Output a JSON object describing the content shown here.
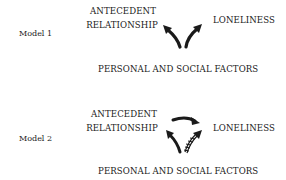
{
  "models": [
    {
      "label": "Model 1",
      "nodes": {
        "antecedent_line1": "ANTECEDENT",
        "antecedent_line2": "RELATIONSHIP",
        "loneliness": "LONELINESS",
        "personal_social": "PERSONAL AND SOCIAL FACTORS"
      },
      "edges": [
        {
          "from": "PERSONAL AND SOCIAL FACTORS",
          "to": "ANTECEDENT RELATIONSHIP",
          "style": "solid"
        },
        {
          "from": "PERSONAL AND SOCIAL FACTORS",
          "to": "LONELINESS",
          "style": "solid"
        }
      ]
    },
    {
      "label": "Model 2",
      "nodes": {
        "antecedent_line1": "ANTECEDENT",
        "antecedent_line2": "RELATIONSHIP",
        "loneliness": "LONELINESS",
        "personal_social": "PERSONAL AND SOCIAL FACTORS"
      },
      "edges": [
        {
          "from": "ANTECEDENT RELATIONSHIP",
          "to": "LONELINESS",
          "style": "solid"
        },
        {
          "from": "PERSONAL AND SOCIAL FACTORS",
          "to": "ANTECEDENT RELATIONSHIP",
          "style": "solid"
        },
        {
          "from": "PERSONAL AND SOCIAL FACTORS",
          "to": "LONELINESS",
          "style": "hatched"
        }
      ]
    }
  ],
  "colors": {
    "ink": "#1a1a1a",
    "background": "#ffffff"
  }
}
